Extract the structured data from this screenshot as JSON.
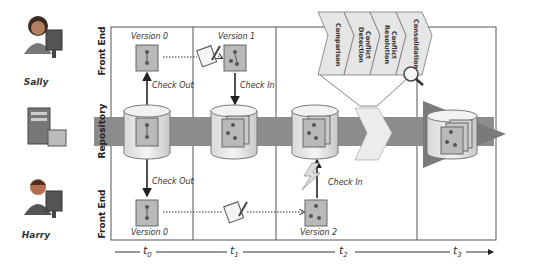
{
  "actors": {
    "top": {
      "name": "Sally"
    },
    "bottom": {
      "name": "Harry"
    }
  },
  "lanes": {
    "top": "Front End",
    "middle": "Repository",
    "bottom": "Front End"
  },
  "versions": {
    "sally_v0": "Version 0",
    "sally_v1": "Version 1",
    "harry_v0": "Version 0",
    "harry_v2": "Version 2"
  },
  "actions": {
    "sally_checkout": "Check Out",
    "sally_checkin": "Check In",
    "harry_checkout": "Check Out",
    "harry_checkin": "Check In"
  },
  "merge_pipeline": {
    "stages": [
      "Comparison",
      "Conflict Detection",
      "Conflict Resolution",
      "Consolidation"
    ]
  },
  "timeline": {
    "ticks": [
      "t0",
      "t1",
      "t2",
      "t3"
    ],
    "subscripts": [
      "0",
      "1",
      "2",
      "3"
    ]
  },
  "colors": {
    "band": "#8c8c8c",
    "doc_fill": "#b9b9b9",
    "frame": "#555555",
    "chevron": "#e8e8e8"
  }
}
